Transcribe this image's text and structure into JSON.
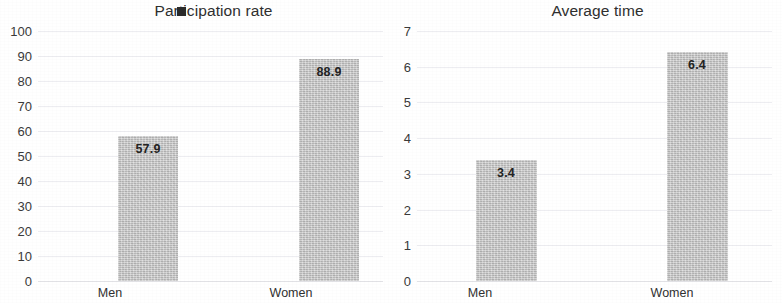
{
  "chart_data": [
    {
      "type": "bar",
      "title": "Participation rate",
      "title_prefix": "Part",
      "title_suffix": "icipation rate",
      "categories": [
        "Men",
        "Women"
      ],
      "values": [
        57.9,
        88.9
      ],
      "value_labels": [
        "57.9",
        "88.9"
      ],
      "xlabel": "",
      "ylabel": "",
      "ylim": [
        0,
        100
      ],
      "ytick_step": 10,
      "yticks": [
        "100",
        "90",
        "80",
        "70",
        "60",
        "50",
        "40",
        "30",
        "20",
        "10",
        "0"
      ],
      "grid": true,
      "legend": "none",
      "bar_color": "#c9c9c9",
      "label_color": "#232323"
    },
    {
      "type": "bar",
      "title": "Average time",
      "categories": [
        "Men",
        "Women"
      ],
      "values": [
        3.4,
        6.4
      ],
      "value_labels": [
        "3.4",
        "6.4"
      ],
      "xlabel": "",
      "ylabel": "",
      "ylim": [
        0,
        7
      ],
      "ytick_step": 1,
      "yticks": [
        "7",
        "6",
        "5",
        "4",
        "3",
        "2",
        "1",
        "0"
      ],
      "grid": true,
      "legend": "none",
      "bar_color": "#c9c9c9",
      "label_color": "#232323"
    }
  ]
}
